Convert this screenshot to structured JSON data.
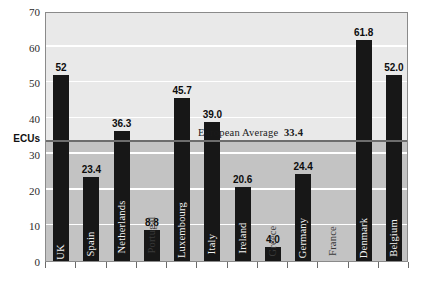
{
  "chart_data": {
    "type": "bar",
    "title": "",
    "subtitle": "",
    "xlabel": "",
    "ylabel": "ECUs",
    "ylim": [
      0,
      70
    ],
    "ytick_step": 10,
    "yticks": [
      "0",
      "10",
      "20",
      "30",
      "40",
      "50",
      "60",
      "70"
    ],
    "grid": "horizontal-white-lines",
    "legend": "none",
    "categories": [
      "UK",
      "Spain",
      "Netherlands",
      "Portugal",
      "Luxembourg",
      "Italy",
      "Ireland",
      "Greece",
      "Germany",
      "France",
      "Denmark",
      "Belgium"
    ],
    "values": [
      52,
      23.4,
      36.3,
      8.8,
      45.7,
      39.0,
      20.6,
      4.0,
      24.4,
      null,
      61.8,
      52.0
    ],
    "value_labels": [
      "52",
      "23.4",
      "36.3",
      "8.8",
      "45.7",
      "39.0",
      "20.6",
      "4.0",
      "24.4",
      "",
      "61.8",
      "52.0"
    ],
    "bars": [
      {
        "name": "UK",
        "value": 52,
        "label": "52",
        "label_on_bar": true
      },
      {
        "name": "Spain",
        "value": 23.4,
        "label": "23.4",
        "label_on_bar": true
      },
      {
        "name": "Netherlands",
        "value": 36.3,
        "label": "36.3",
        "label_on_bar": true
      },
      {
        "name": "Portugal",
        "value": 8.8,
        "label": "8.8",
        "label_on_bar": false
      },
      {
        "name": "Luxembourg",
        "value": 45.7,
        "label": "45.7",
        "label_on_bar": true
      },
      {
        "name": "Italy",
        "value": 39.0,
        "label": "39.0",
        "label_on_bar": true
      },
      {
        "name": "Ireland",
        "value": 20.6,
        "label": "20.6",
        "label_on_bar": true
      },
      {
        "name": "Greece",
        "value": 4.0,
        "label": "4.0",
        "label_on_bar": false
      },
      {
        "name": "Germany",
        "value": 24.4,
        "label": "24.4",
        "label_on_bar": true
      },
      {
        "name": "France",
        "value": 0,
        "label": "",
        "label_on_bar": false
      },
      {
        "name": "Denmark",
        "value": 61.8,
        "label": "61.8",
        "label_on_bar": true
      },
      {
        "name": "Belgium",
        "value": 52.0,
        "label": "52.0",
        "label_on_bar": true
      }
    ],
    "annotations": [
      {
        "name": "european-average",
        "text": "European Average",
        "value_text": "33.4",
        "value": 33.4,
        "type": "horizontal-reference-line"
      }
    ],
    "colors": {
      "bar": "#171717",
      "plot_background_above_average": "#e9e9e9",
      "plot_background_below_average": "#c3c3c3",
      "gridline": "#ffffff",
      "average_line": "#6d6d6d",
      "frame": "#8a8a8a",
      "page_background": "#ffffff"
    }
  },
  "axis": {
    "y_title": "ECUs"
  },
  "footer": {
    "note": ""
  }
}
